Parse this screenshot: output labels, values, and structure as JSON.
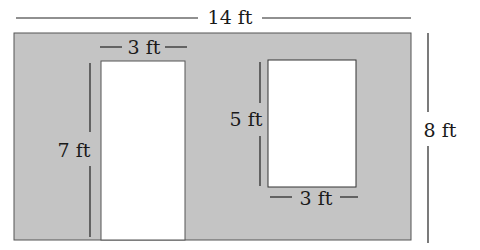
{
  "diagram": {
    "wall": {
      "width_label": "14 ft",
      "height_label": "8 ft",
      "fill": "#c4c4c4"
    },
    "door": {
      "width_label": "3 ft",
      "height_label": "7 ft"
    },
    "window": {
      "width_label": "3 ft",
      "height_label": "5 ft"
    }
  }
}
